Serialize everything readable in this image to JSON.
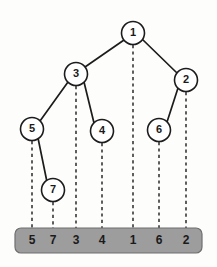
{
  "diagram": {
    "colors": {
      "background": "#fdfdfc",
      "node_fill": "#ffffff",
      "node_stroke": "#1c1c1c",
      "edge": "#1c1c1c",
      "drop_line": "#2a2a2a",
      "array_bar_fill": "#9d9d9d",
      "array_bar_stroke": "#6f6f6f",
      "text": "#1a1a1a"
    },
    "node_radius": 11.5,
    "nodes": [
      {
        "id": "n1",
        "label": "1",
        "cx": 133,
        "cy": 33
      },
      {
        "id": "n3",
        "label": "3",
        "cx": 76,
        "cy": 74
      },
      {
        "id": "n2",
        "label": "2",
        "cx": 186,
        "cy": 80
      },
      {
        "id": "n5",
        "label": "5",
        "cx": 32,
        "cy": 129
      },
      {
        "id": "n4",
        "label": "4",
        "cx": 102,
        "cy": 131
      },
      {
        "id": "n6",
        "label": "6",
        "cx": 159,
        "cy": 130
      },
      {
        "id": "n7",
        "label": "7",
        "cx": 53,
        "cy": 190
      }
    ],
    "edges": [
      {
        "from": "n1",
        "to": "n3",
        "x1": 124,
        "y1": 40,
        "x2": 85,
        "y2": 67
      },
      {
        "from": "n1",
        "to": "n2",
        "x1": 142,
        "y1": 39,
        "x2": 177,
        "y2": 73
      },
      {
        "from": "n3",
        "to": "n5",
        "x1": 68,
        "y1": 82,
        "x2": 40,
        "y2": 121
      },
      {
        "from": "n3",
        "to": "n4",
        "x1": 84,
        "y1": 82,
        "x2": 94,
        "y2": 123
      },
      {
        "from": "n2",
        "to": "n6",
        "x1": 178,
        "y1": 88,
        "x2": 167,
        "y2": 122
      },
      {
        "from": "n5",
        "to": "n7",
        "x1": 38,
        "y1": 138,
        "x2": 47,
        "y2": 182
      }
    ],
    "drop_lines": [
      {
        "node": "n5",
        "label": "5",
        "x": 32,
        "y1": 141,
        "y2": 228
      },
      {
        "node": "n7",
        "label": "7",
        "x": 53,
        "y1": 202,
        "y2": 228
      },
      {
        "node": "n3",
        "label": "3",
        "x": 76,
        "y1": 86,
        "y2": 228
      },
      {
        "node": "n4",
        "label": "4",
        "x": 102,
        "y1": 143,
        "y2": 228
      },
      {
        "node": "n1",
        "label": "1",
        "x": 133,
        "y1": 45,
        "y2": 228
      },
      {
        "node": "n6",
        "label": "6",
        "x": 159,
        "y1": 142,
        "y2": 228
      },
      {
        "node": "n2",
        "label": "2",
        "x": 186,
        "y1": 92,
        "y2": 228
      }
    ],
    "array_bar": {
      "x": 15,
      "y": 228,
      "width": 187,
      "height": 25,
      "corner_radius": 6,
      "cells": [
        {
          "label": "5",
          "cx": 32
        },
        {
          "label": "7",
          "cx": 53
        },
        {
          "label": "3",
          "cx": 76
        },
        {
          "label": "4",
          "cx": 102
        },
        {
          "label": "1",
          "cx": 133
        },
        {
          "label": "6",
          "cx": 159
        },
        {
          "label": "2",
          "cx": 186
        }
      ],
      "sequence": "5 7 3 4 1 6 2"
    }
  }
}
